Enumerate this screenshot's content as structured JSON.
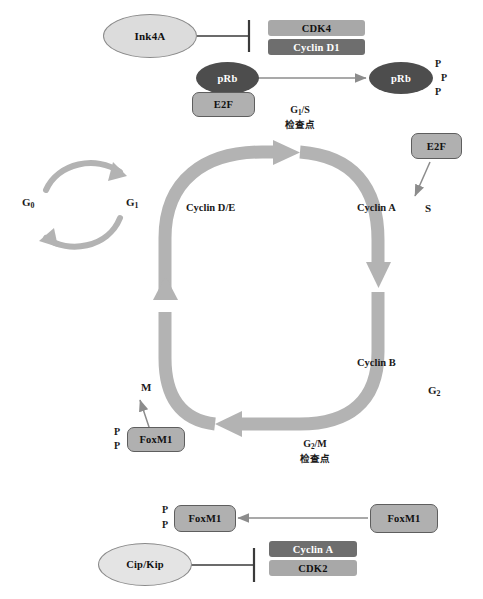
{
  "diagram": {
    "colors": {
      "dark_box": "#6e6e6e",
      "light_box": "#a8a8a8",
      "dark_ellipse": "#4d4d4d",
      "light_ellipse": "#d9d9d9",
      "cycle_arrow": "#b3b3b3",
      "small_arrow": "#8c8c8c",
      "line": "#3a3a3a",
      "text_dark": "#111111",
      "text_light": "#ffffff"
    }
  },
  "top_panel": {
    "ink4a": {
      "label": "Ink4A",
      "shape": "ellipse"
    },
    "cdk4": {
      "label": "CDK4",
      "shape": "box",
      "tone": "light"
    },
    "cyclin_d1": {
      "label": "Cyclin D1",
      "shape": "box",
      "tone": "dark"
    },
    "prb_left": {
      "label": "pRb",
      "shape": "ellipse",
      "tone": "dark"
    },
    "e2f_left": {
      "label": "E2F",
      "shape": "box-round",
      "tone": "light"
    },
    "prb_right": {
      "label": "pRb",
      "shape": "ellipse",
      "tone": "dark"
    },
    "phosphates": [
      "P",
      "P",
      "P"
    ],
    "inhibition": {
      "from": "ink4a",
      "to": "cdk4_cyclin_d1",
      "type": "inhibit"
    },
    "activation": {
      "from": "prb_left",
      "to": "prb_right",
      "type": "arrow"
    }
  },
  "checkpoints": {
    "g1s": {
      "line1": "G1/S",
      "line1_main": "G",
      "line1_sub": "1",
      "line1_tail": "/S",
      "line2": "检查点"
    },
    "g2m": {
      "line1_main": "G",
      "line1_sub": "2",
      "line1_tail": "/M",
      "line2": "检查点"
    }
  },
  "quiescence_loop": {
    "g0": {
      "main": "G",
      "sub": "0"
    },
    "g1": {
      "main": "G",
      "sub": "1"
    },
    "arrows": [
      "g0-to-g1",
      "g1-to-g0"
    ]
  },
  "cycle": {
    "phase_labels": [
      {
        "id": "s",
        "text": "S"
      },
      {
        "id": "g2",
        "main": "G",
        "sub": "2"
      },
      {
        "id": "m",
        "text": "M"
      }
    ],
    "segment_labels": [
      {
        "id": "cyclin-de",
        "text": "Cyclin D/E"
      },
      {
        "id": "cyclin-a",
        "text": "Cyclin A"
      },
      {
        "id": "cyclin-b",
        "text": "Cyclin B"
      }
    ]
  },
  "e2f_s_phase": {
    "e2f": {
      "label": "E2F",
      "shape": "box-round",
      "tone": "light"
    }
  },
  "foxm1_m_phase": {
    "foxm1": {
      "label": "FoxM1",
      "shape": "box-round",
      "tone": "light"
    },
    "phosphates": [
      "P",
      "P"
    ],
    "target": "M"
  },
  "bottom_panel": {
    "foxm1_phospho": {
      "label": "FoxM1",
      "shape": "box-round",
      "tone": "light"
    },
    "phosphates": [
      "P",
      "P"
    ],
    "foxm1_source": {
      "label": "FoxM1",
      "shape": "box-round",
      "tone": "light"
    },
    "cip_kip": {
      "label": "Cip/Kip",
      "shape": "ellipse",
      "tone": "light"
    },
    "cyclin_a": {
      "label": "Cyclin A",
      "shape": "box",
      "tone": "dark"
    },
    "cdk2": {
      "label": "CDK2",
      "shape": "box",
      "tone": "light"
    },
    "inhibition": {
      "from": "cip_kip",
      "to": "cyclin_a_cdk2",
      "type": "inhibit"
    },
    "activation": {
      "from": "foxm1_source",
      "to": "foxm1_phospho",
      "type": "arrow"
    }
  }
}
